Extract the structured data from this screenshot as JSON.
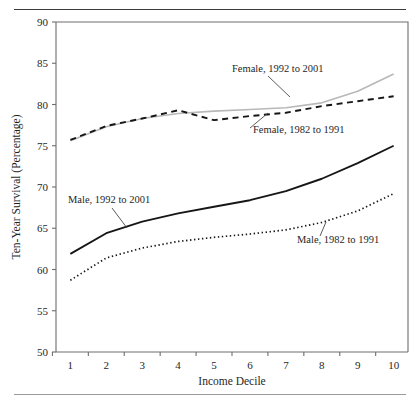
{
  "figure": {
    "has_top_rule": true,
    "has_bottom_rule": true,
    "background": "#ffffff"
  },
  "chart_data": {
    "type": "line",
    "title": "",
    "xlabel": "Income Decile",
    "ylabel": "Ten-Year Survival (Percentage)",
    "x": [
      1,
      2,
      3,
      4,
      5,
      6,
      7,
      8,
      9,
      10
    ],
    "xticklabels": [
      "1",
      "2",
      "3",
      "4",
      "5",
      "6",
      "7",
      "8",
      "9",
      "10"
    ],
    "yticklabels": [
      "50",
      "55",
      "60",
      "65",
      "70",
      "75",
      "80",
      "85",
      "90"
    ],
    "yticks": [
      50,
      55,
      60,
      65,
      70,
      75,
      80,
      85,
      90
    ],
    "xlim": [
      0.6,
      10.4
    ],
    "ylim": [
      50,
      90
    ],
    "grid": false,
    "legend_position": "inline-annotations",
    "series": [
      {
        "name": "Female, 1992 to 2001",
        "style": "solid",
        "color": "#b8b8b8",
        "width": 1.6,
        "values": [
          75.6,
          77.3,
          78.3,
          78.9,
          79.2,
          79.4,
          79.6,
          80.2,
          81.6,
          83.7
        ],
        "label": "Female, 1992 to 2001",
        "label_x": 232,
        "label_y": 72,
        "leader": [
          [
            268,
            76
          ],
          [
            290,
            97
          ]
        ]
      },
      {
        "name": "Female, 1982 to 1991",
        "style": "dashed",
        "color": "#161616",
        "width": 1.9,
        "values": [
          75.7,
          77.4,
          78.3,
          79.3,
          78.1,
          78.6,
          79.0,
          79.8,
          80.4,
          81.0
        ],
        "label": "Female, 1982 to 1991",
        "label_x": 253,
        "label_y": 133,
        "leader": [
          [
            250,
            128
          ],
          [
            268,
            113
          ]
        ]
      },
      {
        "name": "Male, 1992 to 2001",
        "style": "solid",
        "color": "#161616",
        "width": 1.9,
        "values": [
          61.9,
          64.4,
          65.8,
          66.8,
          67.6,
          68.4,
          69.5,
          71.0,
          72.9,
          75.0
        ],
        "label": "Male, 1992 to 2001",
        "label_x": 68,
        "label_y": 203,
        "leader": [
          [
            112,
            208
          ],
          [
            127,
            228
          ]
        ]
      },
      {
        "name": "Male, 1982 to 1991",
        "style": "dotted",
        "color": "#161616",
        "width": 1.7,
        "values": [
          58.7,
          61.4,
          62.6,
          63.4,
          63.9,
          64.3,
          64.8,
          65.7,
          67.1,
          69.2
        ],
        "label": "Male, 1982 to 1991",
        "label_x": 297,
        "label_y": 243,
        "leader": [
          [
            320,
            236
          ],
          [
            326,
            222
          ]
        ]
      }
    ]
  }
}
